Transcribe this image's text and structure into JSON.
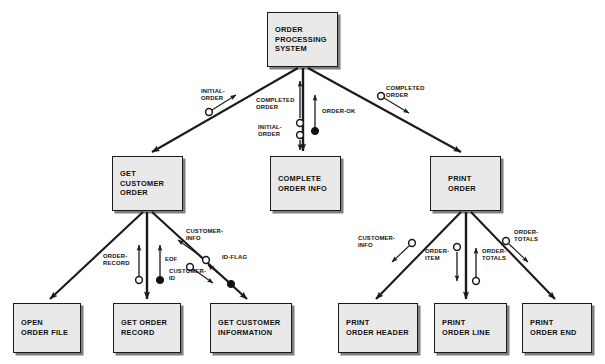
{
  "diagram": {
    "type": "structure-chart",
    "notation": "Yourdon/Constantine",
    "colors": {
      "box_fill": "#e9e9e9",
      "box_border": "#1a1a1a",
      "line": "#1a1a1a",
      "background": "#ffffff"
    }
  },
  "modules": [
    {
      "id": "order-processing-system",
      "level": 0,
      "lines": [
        "ORDER",
        "PROCESSING",
        "SYSTEM"
      ],
      "x": 267,
      "y": 12,
      "w": 71,
      "h": 55
    },
    {
      "id": "get-customer-order",
      "level": 1,
      "lines": [
        "GET",
        "CUSTOMER",
        "ORDER"
      ],
      "x": 112,
      "y": 156,
      "w": 71,
      "h": 55
    },
    {
      "id": "complete-order-info",
      "level": 1,
      "lines": [
        "COMPLETE",
        "ORDER INFO"
      ],
      "x": 270,
      "y": 156,
      "w": 71,
      "h": 55
    },
    {
      "id": "print-order",
      "level": 1,
      "lines": [
        "PRINT",
        "ORDER"
      ],
      "x": 430,
      "y": 156,
      "w": 71,
      "h": 55
    },
    {
      "id": "open-order-file",
      "level": 2,
      "lines": [
        "OPEN",
        "ORDER FILE"
      ],
      "x": 13,
      "y": 303,
      "w": 68,
      "h": 50
    },
    {
      "id": "get-order-record",
      "level": 2,
      "lines": [
        "GET ORDER",
        "RECORD"
      ],
      "x": 113,
      "y": 303,
      "w": 68,
      "h": 50
    },
    {
      "id": "get-customer-information",
      "level": 2,
      "lines": [
        "GET CUSTOMER",
        "INFORMATION"
      ],
      "x": 210,
      "y": 303,
      "w": 82,
      "h": 50
    },
    {
      "id": "print-order-header",
      "level": 2,
      "lines": [
        "PRINT",
        "ORDER HEADER"
      ],
      "x": 338,
      "y": 303,
      "w": 80,
      "h": 50
    },
    {
      "id": "print-order-line",
      "level": 2,
      "lines": [
        "PRINT",
        "ORDER LINE"
      ],
      "x": 434,
      "y": 303,
      "w": 73,
      "h": 50
    },
    {
      "id": "print-order-end",
      "level": 2,
      "lines": [
        "PRINT",
        "ORDER END"
      ],
      "x": 522,
      "y": 303,
      "w": 70,
      "h": 50
    }
  ],
  "connections": [
    {
      "id": "root-to-get-customer-order",
      "from": "order-processing-system",
      "to": "get-customer-order"
    },
    {
      "id": "root-to-complete-order-info",
      "from": "order-processing-system",
      "to": "complete-order-info"
    },
    {
      "id": "root-to-print-order",
      "from": "order-processing-system",
      "to": "print-order"
    },
    {
      "id": "gco-to-open-order-file",
      "from": "get-customer-order",
      "to": "open-order-file"
    },
    {
      "id": "gco-to-get-order-record",
      "from": "get-customer-order",
      "to": "get-order-record"
    },
    {
      "id": "gco-to-get-customer-information",
      "from": "get-customer-order",
      "to": "get-customer-information"
    },
    {
      "id": "po-to-print-order-header",
      "from": "print-order",
      "to": "print-order-header"
    },
    {
      "id": "po-to-print-order-line",
      "from": "print-order",
      "to": "print-order-line"
    },
    {
      "id": "po-to-print-order-end",
      "from": "print-order",
      "to": "print-order-end"
    }
  ],
  "couples": [
    {
      "id": "initial-order-down",
      "label": [
        "INITIAL-",
        "ORDER"
      ],
      "kind": "data",
      "direction": "down",
      "x": 201,
      "y": 88
    },
    {
      "id": "completed-order-up",
      "label": [
        "COMPLETED",
        "ORDER"
      ],
      "kind": "data",
      "direction": "up",
      "x": 256,
      "y": 97
    },
    {
      "id": "initial-order-mid-down",
      "label": [
        "INITIAL-",
        "ORDER"
      ],
      "kind": "data",
      "direction": "down",
      "x": 258,
      "y": 124
    },
    {
      "id": "order-ok-up",
      "label": [
        "ORDER-OK"
      ],
      "kind": "control",
      "direction": "up",
      "x": 313,
      "y": 108
    },
    {
      "id": "completed-order-right",
      "label": [
        "COMPLETED",
        "ORDER"
      ],
      "kind": "data",
      "direction": "down",
      "x": 386,
      "y": 85
    },
    {
      "id": "order-record-up",
      "label": [
        "ORDER-",
        "RECORD"
      ],
      "kind": "data",
      "direction": "up",
      "x": 103,
      "y": 253
    },
    {
      "id": "eof-up",
      "label": [
        "EOF"
      ],
      "kind": "control",
      "direction": "up",
      "x": 160,
      "y": 256
    },
    {
      "id": "customer-info-up-left",
      "label": [
        "CUSTOMER-",
        "INFO"
      ],
      "kind": "data",
      "direction": "up",
      "x": 186,
      "y": 228
    },
    {
      "id": "customer-id-down",
      "label": [
        "CUSTOMER-",
        "ID"
      ],
      "kind": "data",
      "direction": "down",
      "x": 169,
      "y": 265
    },
    {
      "id": "id-flag-up",
      "label": [
        "ID-FLAG"
      ],
      "kind": "control",
      "direction": "up",
      "x": 222,
      "y": 254
    },
    {
      "id": "customer-info-right",
      "label": [
        "CUSTOMER-",
        "INFO"
      ],
      "kind": "data",
      "direction": "down",
      "x": 358,
      "y": 235
    },
    {
      "id": "order-item-down",
      "label": [
        "ORDER-",
        "ITEM"
      ],
      "kind": "data",
      "direction": "down",
      "x": 428,
      "y": 248
    },
    {
      "id": "order-totals-up",
      "label": [
        "ORDER-",
        "TOTALS"
      ],
      "kind": "data",
      "direction": "up",
      "x": 467,
      "y": 248
    },
    {
      "id": "order-totals-right",
      "label": [
        "ORDER-",
        "TOTALS"
      ],
      "kind": "data",
      "direction": "down",
      "x": 505,
      "y": 232
    }
  ]
}
